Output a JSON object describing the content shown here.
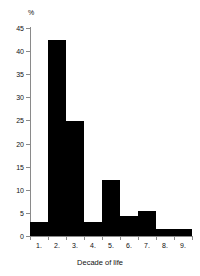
{
  "chart_data": {
    "type": "bar",
    "title": "",
    "subtitle": "",
    "xlabel": "Decade of life",
    "ylabel": "%",
    "categories": [
      "1.",
      "2.",
      "3.",
      "4.",
      "5.",
      "6.",
      "7.",
      "8.",
      "9."
    ],
    "values": [
      3.0,
      42.5,
      24.8,
      3.0,
      12.2,
      4.3,
      5.5,
      1.5,
      1.5
    ],
    "ylim": [
      0,
      45
    ],
    "yticks": [
      0,
      5,
      10,
      15,
      20,
      25,
      30,
      35,
      40,
      45
    ],
    "ytick_labels": [
      "0",
      "5",
      "10",
      "15",
      "20",
      "25",
      "30",
      "35",
      "40",
      "45"
    ],
    "grid": false,
    "legend": false,
    "legend_position": "none",
    "bar_color": "#000000",
    "axis_color": "#8a8a8a",
    "text_color": "#111111",
    "background": "#ffffff",
    "annotations": []
  },
  "axes": {
    "y_unit_label": "%",
    "x_axis_title": "Decade of life"
  }
}
